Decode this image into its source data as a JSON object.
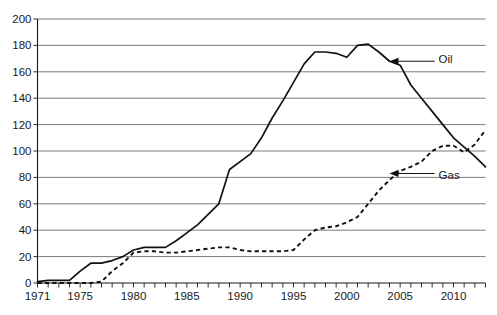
{
  "chart_data": {
    "type": "line",
    "title": "",
    "xlabel": "",
    "ylabel": "",
    "xlim": [
      1971,
      2013
    ],
    "ylim": [
      0,
      200
    ],
    "grid": true,
    "legend_position": "inline-annotations",
    "y_ticks": [
      0,
      20,
      40,
      60,
      80,
      100,
      120,
      140,
      160,
      180,
      200
    ],
    "y_tick_labels": [
      "0",
      "20",
      "40",
      "60",
      "80",
      "100",
      "120",
      "140",
      "160",
      "180",
      "200"
    ],
    "x_ticks": [
      1971,
      1972,
      1973,
      1974,
      1975,
      1976,
      1977,
      1978,
      1979,
      1980,
      1981,
      1982,
      1983,
      1984,
      1985,
      1986,
      1987,
      1988,
      1989,
      1990,
      1991,
      1992,
      1993,
      1994,
      1995,
      1996,
      1997,
      1998,
      1999,
      2000,
      2001,
      2002,
      2003,
      2004,
      2005,
      2006,
      2007,
      2008,
      2009,
      2010,
      2011,
      2012,
      2013
    ],
    "x_tick_labels_shown": [
      "1971",
      "1975",
      "1980",
      "1985",
      "1990",
      "1995",
      "2000",
      "2005",
      "2010"
    ],
    "annotations": [
      {
        "text": "Oil",
        "target_year": 2004,
        "target_value": 168,
        "label_x_year": 2008.6,
        "label_y_value": 170
      },
      {
        "text": "Gas",
        "target_year": 2004,
        "target_value": 83,
        "label_x_year": 2008.6,
        "label_y_value": 82
      }
    ],
    "series": [
      {
        "name": "Oil",
        "style": "solid",
        "x": [
          1971,
          1972,
          1973,
          1974,
          1975,
          1976,
          1977,
          1978,
          1979,
          1980,
          1981,
          1982,
          1983,
          1984,
          1985,
          1986,
          1987,
          1988,
          1989,
          1990,
          1991,
          1992,
          1993,
          1994,
          1995,
          1996,
          1997,
          1998,
          1999,
          2000,
          2001,
          2002,
          2003,
          2004,
          2005,
          2006,
          2007,
          2008,
          2009,
          2010,
          2011,
          2012,
          2013
        ],
        "values": [
          1,
          2,
          2,
          2,
          9,
          15,
          15,
          17,
          20,
          25,
          27,
          27,
          27,
          32,
          38,
          44,
          52,
          60,
          86,
          92,
          98,
          110,
          125,
          138,
          152,
          166,
          175,
          175,
          174,
          171,
          180,
          181,
          175,
          168,
          165,
          150,
          140,
          130,
          120,
          110,
          103,
          96,
          88
        ]
      },
      {
        "name": "Gas",
        "style": "dashed",
        "x": [
          1971,
          1972,
          1973,
          1974,
          1975,
          1976,
          1977,
          1978,
          1979,
          1980,
          1981,
          1982,
          1983,
          1984,
          1985,
          1986,
          1987,
          1988,
          1989,
          1990,
          1991,
          1992,
          1993,
          1994,
          1995,
          1996,
          1997,
          1998,
          1999,
          2000,
          2001,
          2002,
          2003,
          2004,
          2005,
          2006,
          2007,
          2008,
          2009,
          2010,
          2011,
          2012,
          2013
        ],
        "values": [
          0,
          0,
          0,
          0,
          0,
          0,
          1,
          9,
          15,
          23,
          24,
          24,
          23,
          23,
          24,
          25,
          26,
          27,
          27,
          25,
          24,
          24,
          24,
          24,
          25,
          33,
          40,
          42,
          43,
          46,
          50,
          60,
          70,
          78,
          85,
          88,
          92,
          100,
          104,
          104,
          99,
          105,
          116
        ]
      }
    ]
  },
  "axes": {
    "y_axis_name": "value-axis",
    "x_axis_name": "year-axis"
  }
}
